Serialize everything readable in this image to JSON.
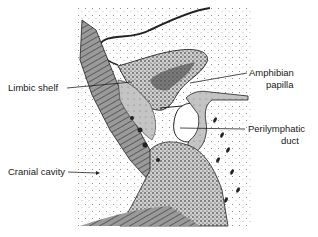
{
  "figure": {
    "labels": {
      "limbic_shelf": "Limbic shelf",
      "amphibian_papilla_line1": "Amphibian",
      "amphibian_papilla_line2": "papilla",
      "perilymphatic_duct_line1": "Perilymphatic",
      "perilymphatic_duct_line2": "duct",
      "cranial_cavity": "Cranial cavity"
    },
    "colors": {
      "ink": "#1a1a1a",
      "stipple": "#555555",
      "tissue": "#bdbdbd",
      "background": "#ffffff"
    }
  }
}
